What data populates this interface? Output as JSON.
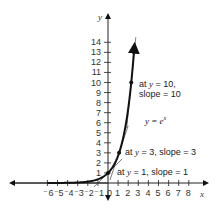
{
  "chart_data": {
    "type": "line",
    "title": "",
    "xlabel": "x",
    "ylabel": "y",
    "xlim": [
      -6,
      8
    ],
    "ylim": [
      0,
      14
    ],
    "grid": false,
    "x_ticks": [
      "⁻6",
      "⁻5",
      "⁻4",
      "⁻3",
      "⁻2",
      "⁻1",
      "0",
      "1",
      "2",
      "3",
      "4",
      "5",
      "6",
      "7",
      "8"
    ],
    "y_ticks": [
      "1",
      "2",
      "3",
      "4",
      "5",
      "6",
      "7",
      "8",
      "9",
      "10",
      "11",
      "12",
      "13",
      "14"
    ],
    "series": [
      {
        "name": "y = e^x",
        "function": "exp(x)",
        "x_range": [
          -6,
          2.64
        ]
      }
    ],
    "tangent_points": [
      {
        "x": 0,
        "y": 1,
        "slope": 1
      },
      {
        "x": 1.0986,
        "y": 3,
        "slope": 3
      },
      {
        "x": 2.3026,
        "y": 10,
        "slope": 10
      }
    ],
    "annotations": [
      {
        "text_a": "at ",
        "var": "y",
        "text_b": " = 10,",
        "line2": "slope = 10"
      },
      {
        "text": "y = e",
        "sup": "x"
      },
      {
        "text_a": "at ",
        "var": "y",
        "text_b": " = 3, slope = 3"
      },
      {
        "text_a": "at ",
        "var": "y",
        "text_b": " = 1, slope = 1"
      }
    ]
  }
}
